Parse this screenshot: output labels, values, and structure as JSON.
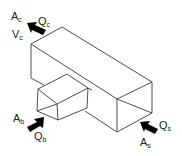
{
  "diagram": {
    "colors": {
      "line": "#3a3a3a",
      "arrow": "#000000",
      "text": "#222222",
      "background": "#ffffff"
    },
    "labels": {
      "common": {
        "area": "A",
        "area_sub": "c",
        "flow": "Q",
        "flow_sub": "c",
        "velocity": "V",
        "velocity_sub": "c"
      },
      "branch": {
        "area": "A",
        "area_sub": "b",
        "flow": "Q",
        "flow_sub": "b"
      },
      "straight": {
        "area": "A",
        "area_sub": "s",
        "flow": "Q",
        "flow_sub": "s"
      }
    },
    "arrows": [
      {
        "id": "arrow-common",
        "direction": "up-left"
      },
      {
        "id": "arrow-branch",
        "direction": "up-right"
      },
      {
        "id": "arrow-straight",
        "direction": "up-left"
      }
    ]
  }
}
